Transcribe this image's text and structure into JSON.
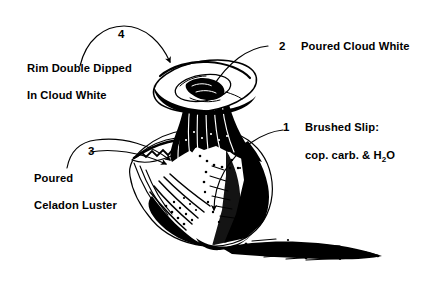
{
  "figure": {
    "background_color": "#ffffff",
    "ink_color": "#000000"
  },
  "annotations": [
    {
      "number": "1",
      "line_1": "Brushed Slip:",
      "line_2_pre": "cop. carb. & H",
      "line_2_sub": "2",
      "line_2_post": "O"
    },
    {
      "number": "2",
      "line_1": "Poured Cloud White"
    },
    {
      "number": "3",
      "line_1": "Poured",
      "line_2": "Celadon Luster"
    },
    {
      "number": "4",
      "line_1": "Rim Double Dipped",
      "line_2": "In Cloud White"
    }
  ]
}
